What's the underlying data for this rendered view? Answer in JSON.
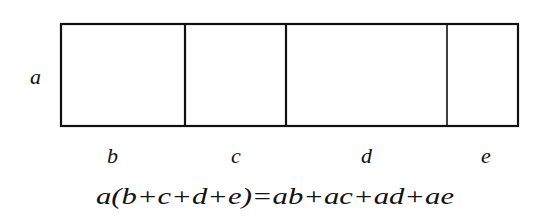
{
  "diagram": {
    "type": "area-model",
    "height_label": "a",
    "segment_labels": [
      "b",
      "c",
      "d",
      "e"
    ],
    "formula": "a(b+c+d+e)=ab+ac+ad+ae"
  }
}
